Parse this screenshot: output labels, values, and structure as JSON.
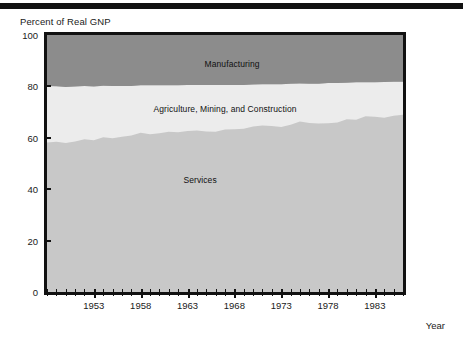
{
  "figure": {
    "title": "Percent of Real GNP",
    "x_axis_caption": "Year"
  },
  "chart_data": {
    "type": "area",
    "stacked": true,
    "title": "Percent of Real GNP",
    "xlabel": "Year",
    "ylabel": "Percent of Real GNP",
    "xlim": [
      1948,
      1986
    ],
    "ylim": [
      0,
      100
    ],
    "grid": false,
    "legend_position": "inline-labels",
    "y_ticks": [
      0,
      20,
      40,
      60,
      80,
      100
    ],
    "x_ticks": [
      1953,
      1958,
      1963,
      1968,
      1973,
      1978,
      1983
    ],
    "x_tick_interval_minor": 1,
    "colors": {
      "services": "#c8c8c8",
      "agriculture_mining_construction": "#ececec",
      "manufacturing": "#8c8c8c",
      "axis": "#111111",
      "background": "#ffffff"
    },
    "x": [
      1948,
      1949,
      1950,
      1951,
      1952,
      1953,
      1954,
      1955,
      1956,
      1957,
      1958,
      1959,
      1960,
      1961,
      1962,
      1963,
      1964,
      1965,
      1966,
      1967,
      1968,
      1969,
      1970,
      1971,
      1972,
      1973,
      1974,
      1975,
      1976,
      1977,
      1978,
      1979,
      1980,
      1981,
      1982,
      1983,
      1984,
      1985,
      1986
    ],
    "series": [
      {
        "name": "Services",
        "values": [
          58.2,
          58.5,
          58.0,
          58.6,
          59.4,
          59.0,
          60.2,
          59.8,
          60.4,
          60.9,
          62.0,
          61.4,
          61.8,
          62.4,
          62.2,
          62.6,
          62.8,
          62.5,
          62.4,
          63.2,
          63.3,
          63.5,
          64.4,
          64.8,
          64.6,
          64.2,
          65.1,
          66.3,
          65.8,
          65.6,
          65.7,
          66.0,
          67.2,
          67.0,
          68.4,
          68.2,
          67.8,
          68.6,
          69.0
        ]
      },
      {
        "name": "Agriculture, Mining, and Construction",
        "values": [
          22.0,
          21.6,
          21.8,
          21.4,
          20.8,
          21.0,
          20.1,
          20.4,
          19.8,
          19.3,
          18.4,
          19.0,
          18.6,
          18.0,
          18.2,
          17.9,
          17.7,
          18.0,
          18.1,
          17.3,
          17.2,
          17.0,
          16.3,
          16.0,
          16.2,
          16.6,
          15.9,
          14.8,
          15.2,
          15.4,
          15.6,
          15.3,
          14.2,
          14.6,
          13.2,
          13.4,
          13.9,
          13.2,
          12.8
        ]
      },
      {
        "name": "Manufacturing",
        "values": [
          19.8,
          19.9,
          20.2,
          20.0,
          19.8,
          20.0,
          19.7,
          19.8,
          19.8,
          19.8,
          19.6,
          19.6,
          19.6,
          19.6,
          19.6,
          19.5,
          19.5,
          19.5,
          19.5,
          19.5,
          19.5,
          19.5,
          19.3,
          19.2,
          19.2,
          19.2,
          19.0,
          18.9,
          19.0,
          19.0,
          18.7,
          18.7,
          18.6,
          18.4,
          18.4,
          18.4,
          18.3,
          18.2,
          18.2
        ]
      }
    ],
    "band_labels": [
      {
        "text": "Manufacturing"
      },
      {
        "text": "Agriculture, Mining, and Construction"
      },
      {
        "text": "Services"
      }
    ]
  }
}
